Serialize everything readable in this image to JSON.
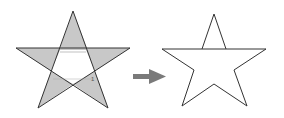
{
  "diagram": {
    "colors": {
      "fill_shaded": "#c8c8c8",
      "stroke": "#333333",
      "arrow": "#7a7a7a",
      "background": "#ffffff"
    },
    "left_star": {
      "label": "shaded-points-star",
      "mark": "1"
    },
    "arrow": {
      "direction": "right"
    },
    "right_star": {
      "label": "outline-star"
    }
  }
}
